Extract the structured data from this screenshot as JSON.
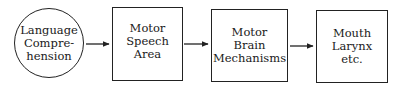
{
  "diagram": {
    "nodes": [
      {
        "id": "language-comprehension",
        "shape": "circle",
        "label": "Language\nCompre-\nhension"
      },
      {
        "id": "motor-speech-area",
        "shape": "box",
        "label": "Motor\nSpeech\nArea"
      },
      {
        "id": "motor-brain-mechanisms",
        "shape": "box",
        "label": "Motor\nBrain\nMechanisms"
      },
      {
        "id": "mouth-larynx",
        "shape": "box",
        "label": "Mouth\nLarynx\netc."
      }
    ],
    "edges": [
      {
        "from": "language-comprehension",
        "to": "motor-speech-area"
      },
      {
        "from": "motor-speech-area",
        "to": "motor-brain-mechanisms"
      },
      {
        "from": "motor-brain-mechanisms",
        "to": "mouth-larynx"
      }
    ],
    "colors": {
      "stroke": "#222222",
      "background": "#ffffff"
    }
  }
}
